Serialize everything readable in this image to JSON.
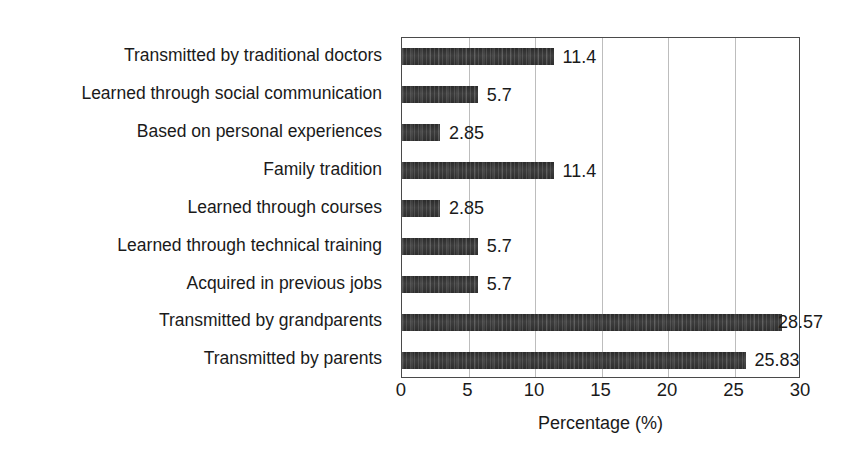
{
  "chart_data": {
    "type": "bar",
    "orientation": "horizontal",
    "title": "",
    "xlabel": "Percentage (%)",
    "ylabel": "",
    "xlim": [
      0,
      30
    ],
    "xticks": [
      0,
      5,
      10,
      15,
      20,
      25,
      30
    ],
    "grid": "vertical",
    "legend": "none",
    "bar_color": "#343434",
    "categories": [
      "Transmitted by traditional doctors",
      "Learned through social communication",
      "Based on personal experiences",
      "Family tradition",
      "Learned through courses",
      "Learned through technical training",
      "Acquired in previous jobs",
      "Transmitted by grandparents",
      "Transmitted by parents"
    ],
    "values": [
      11.4,
      5.7,
      2.85,
      11.4,
      2.85,
      5.7,
      5.7,
      28.57,
      25.83
    ],
    "value_labels": [
      "11.4",
      "5.7",
      "2.85",
      "11.4",
      "2.85",
      "5.7",
      "5.7",
      "28.57",
      "25.83"
    ]
  }
}
